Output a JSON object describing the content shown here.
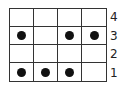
{
  "grid": {
    "rows": 4,
    "cols": 4,
    "row_labels": [
      "4",
      "3",
      "2",
      "1"
    ],
    "cells": [
      [
        0,
        0,
        0,
        0
      ],
      [
        1,
        0,
        1,
        1
      ],
      [
        0,
        0,
        0,
        0
      ],
      [
        1,
        1,
        1,
        0
      ]
    ]
  },
  "colors": {
    "line": "#333333",
    "dot": "#111111",
    "background": "#ffffff"
  }
}
